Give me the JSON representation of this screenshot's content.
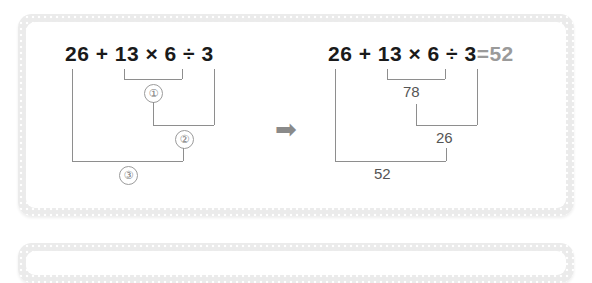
{
  "background": "#ffffff",
  "colors": {
    "panel_border": "#ebebeb",
    "panel_fill": "#ffffff",
    "expression_text": "#1a1a1a",
    "result_text": "#555555",
    "bracket_line": "#8e8e8e",
    "circle_number": "#7d7d7d",
    "arrow": "#8a8a8a",
    "equals_value": "#9a9a9a"
  },
  "left": {
    "expression": "26 + 13 × 6 ÷ 3",
    "steps": [
      {
        "label": "①",
        "order": 1,
        "operation": "13 × 6"
      },
      {
        "label": "②",
        "order": 2,
        "operation": "78 ÷ 3"
      },
      {
        "label": "③",
        "order": 3,
        "operation": "26 + 26"
      }
    ]
  },
  "arrow": {
    "glyph": "➡",
    "name": "right-arrow"
  },
  "right": {
    "expression": "26 + 13 × 6 ÷ 3",
    "equals_sign": "=",
    "final_value": "52",
    "results": [
      {
        "value": "78",
        "from": "13 × 6"
      },
      {
        "value": "26",
        "from": "78 ÷ 3"
      },
      {
        "value": "52",
        "from": "26 + 26"
      }
    ]
  }
}
